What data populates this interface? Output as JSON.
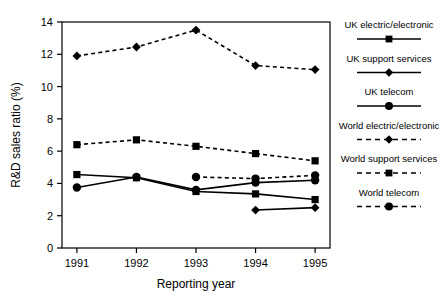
{
  "chart_data": {
    "type": "line",
    "title": "",
    "xlabel": "Reporting year",
    "ylabel": "R&D sales ratio (%)",
    "categories": [
      "1991",
      "1992",
      "1993",
      "1994",
      "1995"
    ],
    "x": [
      1991,
      1992,
      1993,
      1994,
      1995
    ],
    "xlim": [
      1990.75,
      1995.25
    ],
    "ylim": [
      0,
      14
    ],
    "yticks": [
      0,
      2,
      4,
      6,
      8,
      10,
      12,
      14
    ],
    "ytick_labels": [
      "0",
      "2",
      "4",
      "6",
      "8",
      "10",
      "12",
      "14"
    ],
    "grid": false,
    "legend_position": "right",
    "series": [
      {
        "name": "UK electric/electronic",
        "marker": "square",
        "line": "solid",
        "color": "#000000",
        "x": [
          1991,
          1992,
          1993,
          1994,
          1995
        ],
        "values": [
          4.55,
          4.35,
          3.5,
          3.35,
          3.0
        ]
      },
      {
        "name": "UK support services",
        "marker": "diamond",
        "line": "solid",
        "color": "#000000",
        "x": [
          1994,
          1995
        ],
        "values": [
          2.35,
          2.5
        ]
      },
      {
        "name": "UK telecom",
        "marker": "circle",
        "line": "solid",
        "color": "#000000",
        "x": [
          1991,
          1992,
          1993,
          1994,
          1995
        ],
        "values": [
          3.75,
          4.4,
          3.6,
          4.05,
          4.2
        ]
      },
      {
        "name": "World electric/electronic",
        "marker": "diamond",
        "line": "dashed",
        "color": "#000000",
        "x": [
          1991,
          1992,
          1993,
          1994,
          1995
        ],
        "values": [
          11.9,
          12.45,
          13.5,
          11.3,
          11.05
        ]
      },
      {
        "name": "World support services",
        "marker": "square",
        "line": "dashed",
        "color": "#000000",
        "x": [
          1991,
          1992,
          1993,
          1994,
          1995
        ],
        "values": [
          6.4,
          6.7,
          6.3,
          5.85,
          5.4
        ]
      },
      {
        "name": "World telecom",
        "marker": "circle",
        "line": "dashed",
        "color": "#000000",
        "x": [
          1993,
          1994,
          1995
        ],
        "values": [
          4.4,
          4.3,
          4.5
        ]
      }
    ]
  },
  "legend": {
    "entries": [
      {
        "label": "UK electric/electronic",
        "marker": "square",
        "line": "solid"
      },
      {
        "label": "UK support services",
        "marker": "diamond",
        "line": "solid"
      },
      {
        "label": "UK telecom",
        "marker": "circle",
        "line": "solid"
      },
      {
        "label": "World electric/electronic",
        "marker": "diamond",
        "line": "dashed"
      },
      {
        "label": "World support services",
        "marker": "square",
        "line": "dashed"
      },
      {
        "label": "World telecom",
        "marker": "circle",
        "line": "dashed"
      }
    ]
  }
}
